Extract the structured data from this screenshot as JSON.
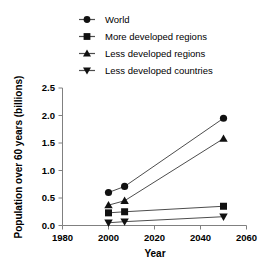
{
  "chart_data": {
    "type": "line",
    "title": "",
    "subtitle": "",
    "xlabel": "Year",
    "ylabel": "Population over 60 years (billions)",
    "xlim": [
      1980,
      2060
    ],
    "ylim": [
      0.0,
      2.5
    ],
    "xticks": [
      1980,
      2000,
      2020,
      2040,
      2060
    ],
    "xticklabels": [
      "1980",
      "2000",
      "2020",
      "2040",
      "2060"
    ],
    "yticks": [
      0.0,
      0.5,
      1.0,
      1.5,
      2.0,
      2.5
    ],
    "yticklabels": [
      "0.0",
      "0.5",
      "1.0",
      "1.5",
      "2.0",
      "2.5"
    ],
    "grid": false,
    "legend_position": "top",
    "x": [
      2000,
      2007,
      2050
    ],
    "series": [
      {
        "name": "World",
        "marker": "circle",
        "values": [
          0.6,
          0.71,
          1.95
        ]
      },
      {
        "name": "More developed regions",
        "marker": "square",
        "values": [
          0.23,
          0.25,
          0.35
        ]
      },
      {
        "name": "Less developed regions",
        "marker": "triangle-up",
        "values": [
          0.37,
          0.45,
          1.58
        ]
      },
      {
        "name": "Less developed countries",
        "marker": "triangle-down",
        "values": [
          0.05,
          0.07,
          0.16
        ]
      }
    ]
  },
  "legend": {
    "items": [
      {
        "label": "World",
        "marker": "circle"
      },
      {
        "label": "More developed regions",
        "marker": "square"
      },
      {
        "label": "Less developed regions",
        "marker": "triangle-up"
      },
      {
        "label": "Less developed countries",
        "marker": "triangle-down"
      }
    ]
  },
  "axes": {
    "x_title": "Year",
    "y_title": "Population over 60 years (billions)"
  },
  "colors": {
    "marker": "#111111",
    "line": "#4d4d4d",
    "axis": "#808080",
    "background": "#ffffff"
  }
}
